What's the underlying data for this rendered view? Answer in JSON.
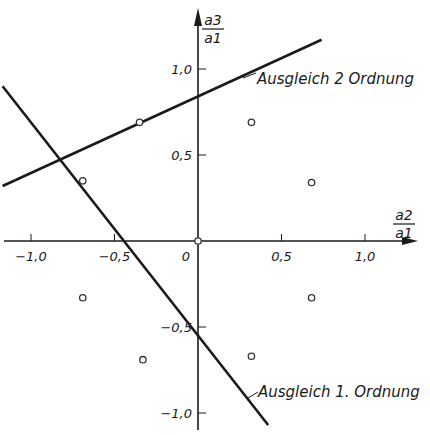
{
  "chart_data": {
    "type": "scatter",
    "title": "",
    "xlabel": "a2/a1",
    "ylabel": "a3/a1",
    "xlabel_num": "a2",
    "xlabel_den": "a1",
    "ylabel_num": "a3",
    "ylabel_den": "a1",
    "xlim": [
      -1.18,
      1.25
    ],
    "ylim": [
      -1.08,
      1.38
    ],
    "grid": false,
    "x_ticks": [
      {
        "value": -1.0,
        "label": "-1,0"
      },
      {
        "value": -0.5,
        "label": "-0,5"
      },
      {
        "value": 0,
        "label": "0"
      },
      {
        "value": 0.5,
        "label": "0,5"
      },
      {
        "value": 1.0,
        "label": "1,0"
      }
    ],
    "y_ticks": [
      {
        "value": 1.0,
        "label": "1,0"
      },
      {
        "value": 0.5,
        "label": "0,5"
      },
      {
        "value": -0.5,
        "label": "-0,5"
      },
      {
        "value": -1.0,
        "label": "-1,0"
      }
    ],
    "points": [
      {
        "x": 0.0,
        "y": 0.0
      },
      {
        "x": -0.35,
        "y": 0.69
      },
      {
        "x": -0.69,
        "y": 0.35
      },
      {
        "x": 0.32,
        "y": 0.69
      },
      {
        "x": 0.68,
        "y": 0.34
      },
      {
        "x": -0.69,
        "y": -0.33
      },
      {
        "x": -0.33,
        "y": -0.69
      },
      {
        "x": 0.32,
        "y": -0.67
      },
      {
        "x": 0.68,
        "y": -0.33
      }
    ],
    "series": [
      {
        "name": "Ausgleich 2 Ordnung",
        "type": "line",
        "x": [
          -1.17,
          0.74
        ],
        "y": [
          0.32,
          1.17
        ]
      },
      {
        "name": "Ausgleich 1. Ordnung",
        "type": "line",
        "x": [
          -1.17,
          0.42
        ],
        "y": [
          0.9,
          -1.07
        ]
      }
    ],
    "annotations": [
      {
        "text": "Ausgleich 2 Ordnung",
        "target_series": 0
      },
      {
        "text": "Ausgleich 1. Ordnung",
        "target_series": 1
      }
    ]
  }
}
